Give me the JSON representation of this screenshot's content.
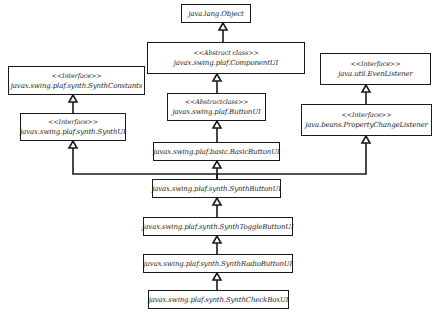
{
  "diagram": {
    "type": "uml-class-hierarchy",
    "line_color": "#1a1a1a",
    "nodes": [
      {
        "id": "object",
        "stereotype": "",
        "name": "java.lang.Object",
        "x": 181,
        "y": 4,
        "w": 70,
        "h": 19
      },
      {
        "id": "componentui",
        "stereotype": "<<Abstract class>>",
        "name": "javax.swing.plaf.ComponentUI",
        "x": 147,
        "y": 42,
        "w": 158,
        "h": 32
      },
      {
        "id": "synthconstants",
        "stereotype": "<<Interface>>",
        "name": "javax.swing.plaf.synth.SynthConstants",
        "x": 8,
        "y": 66,
        "w": 137,
        "h": 29
      },
      {
        "id": "evenlistener",
        "stereotype": "<<Interface>>",
        "name": "java.util.EvenListener",
        "x": 320,
        "y": 53,
        "w": 111,
        "h": 32
      },
      {
        "id": "buttonui",
        "stereotype": "<<Abstractclass>>",
        "name": "javax.swing.plaf.ButtonUI",
        "x": 167,
        "y": 93,
        "w": 99,
        "h": 28
      },
      {
        "id": "synthui",
        "stereotype": "<<Interface>>",
        "name": "javax.swing.plaf.synth.SynthUI",
        "x": 20,
        "y": 113,
        "w": 106,
        "h": 28
      },
      {
        "id": "propertychangelistener",
        "stereotype": "<<Interface>>",
        "name": "java.beans.PropertyChangeListener",
        "x": 301,
        "y": 104,
        "w": 131,
        "h": 32
      },
      {
        "id": "basicbuttonui",
        "stereotype": "",
        "name": "javax.swing.plaf.basic.BasicButtonUI",
        "x": 153,
        "y": 142,
        "w": 127,
        "h": 19
      },
      {
        "id": "synthbuttonui",
        "stereotype": "",
        "name": "javax.swing.plaf.synth.SynthButtonUI",
        "x": 152,
        "y": 179,
        "w": 129,
        "h": 19
      },
      {
        "id": "synthtogglebuttonui",
        "stereotype": "",
        "name": "javax.swing.plaf.synth.SynthToggleButtonUI",
        "x": 143,
        "y": 217,
        "w": 150,
        "h": 19
      },
      {
        "id": "synthradiobuttonui",
        "stereotype": "",
        "name": "javax.swing.plaf.synth.SynthRadioButtonUI",
        "x": 143,
        "y": 254,
        "w": 150,
        "h": 19
      },
      {
        "id": "synthcheckboxui",
        "stereotype": "",
        "name": "javax.swing.plaf.synth.SynthCheckBoxUI",
        "x": 148,
        "y": 290,
        "w": 141,
        "h": 19
      }
    ],
    "edges": [
      {
        "from": "componentui",
        "to": "object",
        "kind": "generalization"
      },
      {
        "from": "buttonui",
        "to": "componentui",
        "kind": "generalization"
      },
      {
        "from": "synthui",
        "to": "synthconstants",
        "kind": "generalization"
      },
      {
        "from": "propertychangelistener",
        "to": "evenlistener",
        "kind": "generalization"
      },
      {
        "from": "basicbuttonui",
        "to": "buttonui",
        "kind": "generalization"
      },
      {
        "from": "synthbuttonui",
        "to": "basicbuttonui",
        "kind": "generalization"
      },
      {
        "from": "synthbuttonui",
        "to": "synthui",
        "kind": "realization"
      },
      {
        "from": "synthbuttonui",
        "to": "propertychangelistener",
        "kind": "realization"
      },
      {
        "from": "synthtogglebuttonui",
        "to": "synthbuttonui",
        "kind": "generalization"
      },
      {
        "from": "synthradiobuttonui",
        "to": "synthtogglebuttonui",
        "kind": "generalization"
      },
      {
        "from": "synthcheckboxui",
        "to": "synthradiobuttonui",
        "kind": "generalization"
      }
    ]
  }
}
